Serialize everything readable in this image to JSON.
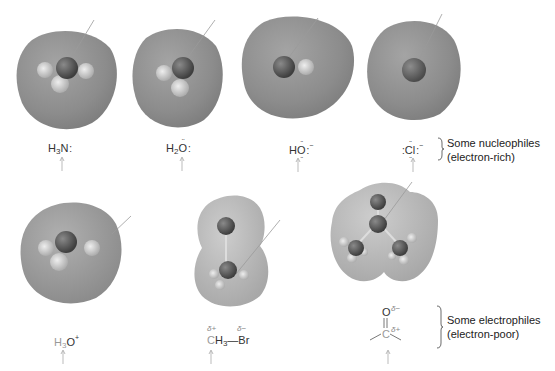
{
  "colors": {
    "background": "#ffffff",
    "surface_rich": "#8f8f8f",
    "surface_poor": "#b8b8b8",
    "atom_dark": "#555555",
    "atom_light": "#cfcfcf",
    "pointer_line": "#9a9a9a",
    "text": "#333333",
    "faint_text": "#999999"
  },
  "nucleophiles": {
    "group_label_line1": "Some nucleophiles",
    "group_label_line2": "(electron-rich)",
    "items": [
      {
        "name": "ammonia",
        "formula_main": "H",
        "sub": "3",
        "atom": "N",
        "suffix": ":",
        "arrow": "up-arrow-icon"
      },
      {
        "name": "water",
        "formula_main": "H",
        "sub": "2",
        "atom": "O",
        "suffix": ":",
        "arrow": "up-arrow-icon"
      },
      {
        "name": "hydroxide",
        "formula_main": "H",
        "atom": "O",
        "suffix": ":",
        "charge": "−",
        "arrow": "up-arrow-icon"
      },
      {
        "name": "chloride",
        "prefix": ":",
        "atom": "Cl",
        "suffix": ":",
        "charge": "−",
        "arrow": "up-arrow-icon"
      }
    ]
  },
  "electrophiles": {
    "group_label_line1": "Some electrophiles",
    "group_label_line2": "(electron-poor)",
    "items": [
      {
        "name": "hydronium",
        "formula_main": "H",
        "sub": "3",
        "atom": "O",
        "charge": "+",
        "arrow": "up-arrow-icon"
      },
      {
        "name": "bromomethane",
        "carbon": "C",
        "h": "H",
        "sub": "3",
        "bond": "—",
        "br": "Br",
        "delta_plus": "δ+",
        "delta_minus": "δ−",
        "arrow": "up-arrow-icon"
      },
      {
        "name": "carbonyl",
        "oxygen": "O",
        "carbon": "C",
        "delta_minus": "δ−",
        "delta_plus": "δ+",
        "arrow": "up-arrow-icon"
      }
    ]
  }
}
